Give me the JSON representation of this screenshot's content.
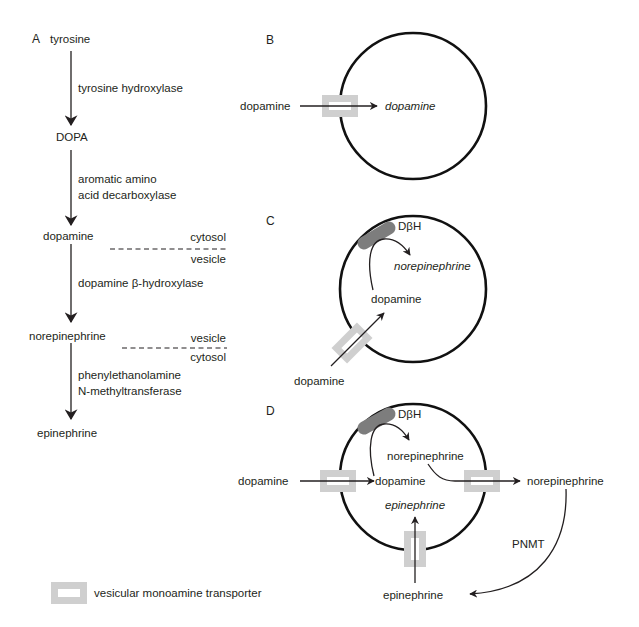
{
  "figure": {
    "panels": {
      "A": {
        "label": "A",
        "pathway": [
          {
            "compound": "tyrosine",
            "enzyme": "tyrosine hydroxylase"
          },
          {
            "compound": "DOPA",
            "enzyme_line1": "aromatic amino",
            "enzyme_line2": "acid decarboxylase"
          },
          {
            "compound": "dopamine",
            "enzyme": "dopamine β-hydroxylase"
          },
          {
            "compound": "norepinephrine",
            "enzyme_line1": "phenylethanolamine",
            "enzyme_line2": "N-methyltransferase"
          },
          {
            "compound": "epinephrine"
          }
        ],
        "compartments": {
          "boundary1": {
            "above": "cytosol",
            "below": "vesicle"
          },
          "boundary2": {
            "above": "vesicle",
            "below": "cytosol"
          }
        }
      },
      "B": {
        "label": "B",
        "outside": "dopamine",
        "inside": "dopamine"
      },
      "C": {
        "label": "C",
        "enzyme": "DβH",
        "inside_product": "norepinephrine",
        "inside_substrate": "dopamine",
        "outside": "dopamine"
      },
      "D": {
        "label": "D",
        "enzyme": "DβH",
        "outside_in": "dopamine",
        "inside_substrate": "dopamine",
        "inside_product": "norepinephrine",
        "inside_epi": "epinephrine",
        "outside_norepi": "norepinephrine",
        "outside_epi": "epinephrine",
        "cytosolic_enzyme": "PNMT"
      }
    },
    "legend": {
      "vmat_label": "vesicular monoamine transporter"
    },
    "colors": {
      "ink": "#231f20",
      "transporter": "#cfcfcf",
      "enzyme": "#7d7d7d"
    }
  }
}
